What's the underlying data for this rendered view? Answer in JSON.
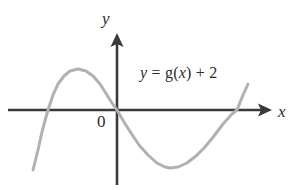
{
  "figure": {
    "width": 296,
    "height": 190,
    "background_color": "#ffffff"
  },
  "labels": {
    "y_axis": "y",
    "x_axis": "x",
    "origin": "0",
    "equation_full": "y = g(x) + 2",
    "equation_parts": {
      "lhs_var": "y",
      "equals": " = ",
      "func_name": "g",
      "open_paren": "(",
      "arg_var": "x",
      "close_paren": ")",
      "plus": " + ",
      "constant": "2"
    }
  },
  "colors": {
    "axis": "#3a3a3a",
    "curve": "#b5b0ad",
    "text": "#2b2b2b",
    "background": "#ffffff"
  },
  "chart_data": {
    "type": "line",
    "title": "y = g(x) + 2",
    "xlabel": "x",
    "ylabel": "y",
    "grid": false,
    "legend": null,
    "annotations": [
      {
        "text": "y = g(x) + 2",
        "x_px": 190,
        "y_px": 77
      },
      {
        "text": "0",
        "x_px": 104,
        "y_px": 124
      }
    ],
    "axes": {
      "x_axis_y_px": 110,
      "x_axis_start_px": 8,
      "x_axis_end_px": 272,
      "x_axis_arrow": "right",
      "y_axis_x_px": 117,
      "y_axis_top_px": 33,
      "y_axis_bottom_px": 185,
      "y_axis_arrow": "up",
      "origin_px": [
        117,
        110
      ],
      "ticks": [],
      "tick_labels": []
    },
    "curve": {
      "name": "y = g(x) + 2",
      "color": "#b5b0ad",
      "width_px": 3,
      "shape": "cubic with local max left of origin and local min right of origin",
      "x_intercepts_px": [
        48,
        117,
        237
      ],
      "local_maximum_px": [
        78,
        69
      ],
      "local_minimum_px": [
        170,
        168
      ],
      "start_point_px": [
        33,
        170
      ],
      "end_point_px": [
        248,
        84
      ],
      "points_px": [
        [
          33,
          170
        ],
        [
          38,
          150
        ],
        [
          42,
          132
        ],
        [
          46,
          117
        ],
        [
          48,
          110
        ],
        [
          53,
          95
        ],
        [
          58,
          84
        ],
        [
          64,
          76
        ],
        [
          70,
          71
        ],
        [
          78,
          69
        ],
        [
          86,
          71
        ],
        [
          93,
          76
        ],
        [
          100,
          84
        ],
        [
          107,
          95
        ],
        [
          112,
          103
        ],
        [
          117,
          110
        ],
        [
          124,
          122
        ],
        [
          131,
          133
        ],
        [
          139,
          145
        ],
        [
          148,
          155
        ],
        [
          157,
          163
        ],
        [
          165,
          167
        ],
        [
          170,
          168
        ],
        [
          178,
          167
        ],
        [
          187,
          163
        ],
        [
          196,
          156
        ],
        [
          205,
          147
        ],
        [
          214,
          136
        ],
        [
          223,
          124
        ],
        [
          232,
          114
        ],
        [
          237,
          110
        ],
        [
          243,
          95
        ],
        [
          248,
          84
        ]
      ]
    }
  }
}
